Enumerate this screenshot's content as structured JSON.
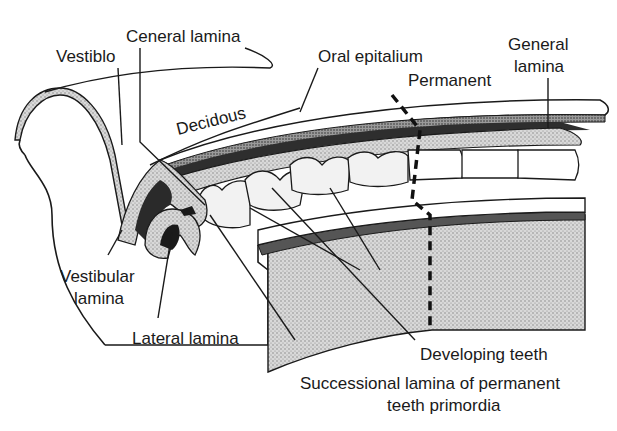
{
  "diagram": {
    "labels": {
      "vestiblo": "Vestiblo",
      "ceneral_lamina": "Ceneral lamina",
      "oral_epitalium": "Oral epitalium",
      "permanent": "Permanent",
      "general_lamina_line1": "General",
      "general_lamina_line2": "lamina",
      "decidous": "Decidous",
      "vestibular_lamina_line1": "Vestibular",
      "vestibular_lamina_line2": "lamina",
      "lateral_lamina": "Lateral lamina",
      "developing_teeth": "Developing teeth",
      "successional_line1": "Successional lamina of permanent",
      "successional_line2": "teeth primordia"
    },
    "colors": {
      "ink": "#1a1a1a",
      "stipple_light": "#cfcfcf",
      "stipple_mid": "#a8a8a8",
      "dark": "#2a2a2a",
      "paper": "#ffffff"
    }
  }
}
